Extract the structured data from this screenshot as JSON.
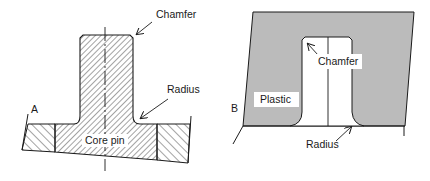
{
  "figure_a": {
    "letter": "A",
    "labels": {
      "chamfer": "Chamfer",
      "radius": "Radius",
      "core_pin": "Core pin"
    }
  },
  "figure_b": {
    "letter": "B",
    "labels": {
      "chamfer": "Chamfer",
      "radius": "Radius",
      "plastic": "Plastic"
    }
  },
  "colors": {
    "line": "#1a1a1a",
    "stipple": "#8a8a8a",
    "background": "#ffffff"
  }
}
